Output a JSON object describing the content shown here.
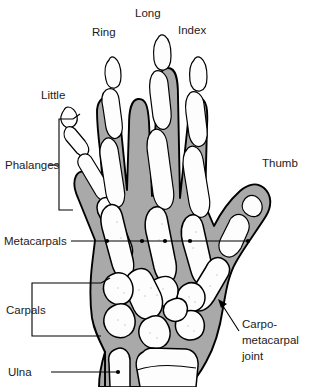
{
  "figure": {
    "background_color": "#ffffff",
    "soft_tissue_color": "#a9a9a9",
    "bone_color": "#fdfdfd",
    "outline_color": "#000000",
    "text_color": "#1b1b1b"
  },
  "labels": {
    "little": "Little",
    "ring": "Ring",
    "long": "Long",
    "index": "Index",
    "thumb": "Thumb",
    "phalanges": "Phalanges",
    "metacarpals": "Metacarpals",
    "carpals": "Carpals",
    "ulna": "Ulna",
    "carpometacarpal_line1": "Carpo-",
    "carpometacarpal_line2": "metacarpal",
    "carpometacarpal_line3": "joint"
  },
  "annotations": {
    "metacarpal_dot_count": 5,
    "bracket_labels": [
      "Phalanges",
      "Carpals"
    ],
    "arrow_labels": [
      "Carpo-metacarpal joint"
    ],
    "leader_labels": [
      "Metacarpals",
      "Ulna"
    ]
  }
}
